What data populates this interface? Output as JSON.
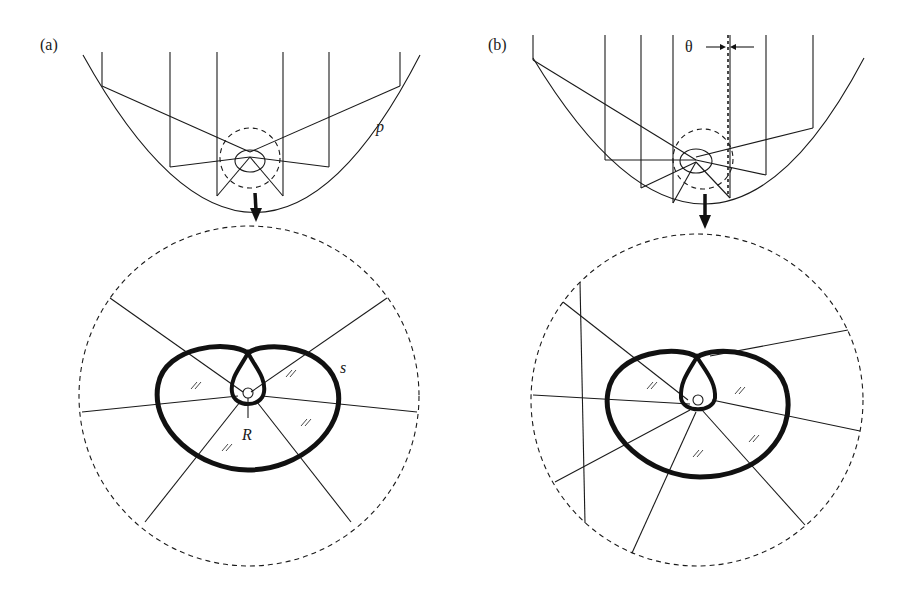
{
  "figure": {
    "panels": [
      {
        "id": "a",
        "label": "(a)",
        "curve_label": "p",
        "surface_label": "s",
        "radius_label": "R"
      },
      {
        "id": "b",
        "label": "(b)",
        "angle_label": "θ"
      }
    ],
    "colors": {
      "ink": "#1a1a1a",
      "background": "#ffffff"
    }
  }
}
